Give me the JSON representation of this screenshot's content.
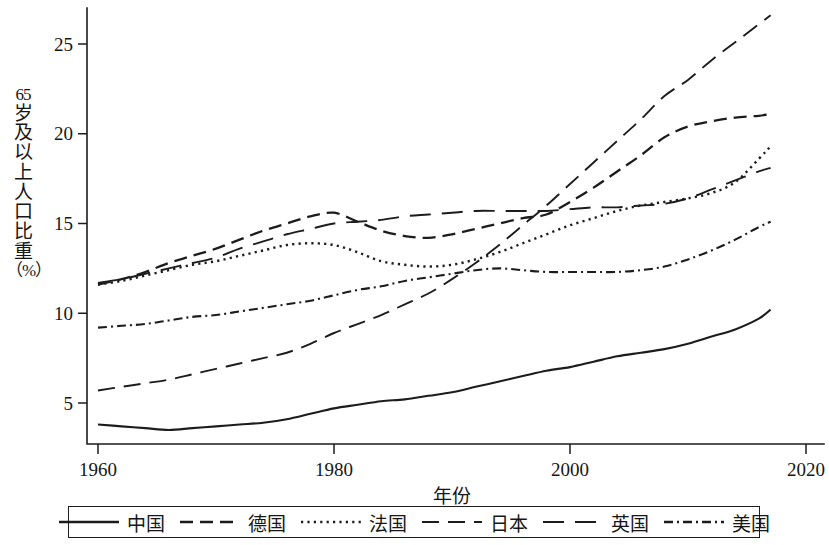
{
  "chart_data": {
    "type": "line",
    "title": "",
    "xlabel": "年份",
    "ylabel": "65岁及以上人口比重（%）",
    "xlim": [
      1960,
      2020
    ],
    "ylim": [
      2.8,
      27.6
    ],
    "xticks": [
      1960,
      1980,
      2000,
      2020
    ],
    "yticks": [
      5,
      10,
      15,
      20,
      25
    ],
    "grid": false,
    "legend_position": "bottom",
    "x": [
      1960,
      1962,
      1964,
      1966,
      1968,
      1970,
      1972,
      1974,
      1976,
      1978,
      1980,
      1982,
      1984,
      1986,
      1988,
      1990,
      1992,
      1994,
      1996,
      1998,
      2000,
      2002,
      2004,
      2006,
      2008,
      2010,
      2012,
      2014,
      2016,
      2017
    ],
    "series": [
      {
        "name": "中国",
        "dash": "solid",
        "values": [
          3.8,
          3.7,
          3.6,
          3.5,
          3.6,
          3.7,
          3.8,
          3.9,
          4.1,
          4.4,
          4.7,
          4.9,
          5.1,
          5.2,
          5.4,
          5.6,
          5.9,
          6.2,
          6.5,
          6.8,
          7.0,
          7.3,
          7.6,
          7.8,
          8.0,
          8.3,
          8.7,
          9.1,
          9.7,
          10.2
        ]
      },
      {
        "name": "德国",
        "dash": "dashed",
        "values": [
          11.6,
          11.9,
          12.3,
          12.8,
          13.2,
          13.6,
          14.1,
          14.6,
          15.0,
          15.4,
          15.6,
          15.1,
          14.6,
          14.3,
          14.2,
          14.4,
          14.7,
          15.0,
          15.3,
          15.5,
          16.2,
          17.0,
          17.9,
          18.8,
          19.8,
          20.4,
          20.7,
          20.9,
          21.0,
          21.1
        ]
      },
      {
        "name": "法国",
        "dash": "dotted",
        "values": [
          11.6,
          11.8,
          12.1,
          12.4,
          12.7,
          12.9,
          13.2,
          13.5,
          13.8,
          13.9,
          13.8,
          13.4,
          12.9,
          12.7,
          12.6,
          12.7,
          13.0,
          13.4,
          13.9,
          14.4,
          14.9,
          15.3,
          15.7,
          16.0,
          16.2,
          16.4,
          16.7,
          17.3,
          18.6,
          19.3
        ]
      },
      {
        "name": "日本",
        "dash": "longdash",
        "values": [
          5.7,
          5.9,
          6.1,
          6.3,
          6.6,
          6.9,
          7.2,
          7.5,
          7.8,
          8.3,
          8.9,
          9.4,
          9.9,
          10.5,
          11.1,
          11.9,
          12.8,
          13.8,
          14.9,
          16.0,
          17.2,
          18.4,
          19.6,
          20.8,
          22.1,
          23.0,
          24.1,
          25.1,
          26.1,
          26.6
        ]
      },
      {
        "name": "英国",
        "dash": "longdash2",
        "values": [
          11.7,
          11.9,
          12.2,
          12.5,
          12.8,
          13.1,
          13.6,
          14.0,
          14.4,
          14.7,
          15.0,
          15.1,
          15.2,
          15.4,
          15.5,
          15.6,
          15.7,
          15.7,
          15.7,
          15.7,
          15.8,
          15.9,
          15.9,
          16.0,
          16.1,
          16.4,
          16.9,
          17.4,
          17.9,
          18.1
        ]
      },
      {
        "name": "美国",
        "dash": "dashdot",
        "values": [
          9.2,
          9.3,
          9.4,
          9.6,
          9.8,
          9.9,
          10.1,
          10.3,
          10.5,
          10.7,
          11.0,
          11.3,
          11.5,
          11.8,
          12.0,
          12.2,
          12.4,
          12.5,
          12.4,
          12.3,
          12.3,
          12.3,
          12.3,
          12.4,
          12.6,
          13.0,
          13.5,
          14.1,
          14.8,
          15.1
        ]
      }
    ]
  },
  "axis": {
    "y_title_chars": [
      "65",
      "岁",
      "及",
      "以",
      "上",
      "人",
      "口",
      "比",
      "重",
      "（%）"
    ],
    "x_title": "年份",
    "ytick_labels": [
      "5",
      "10",
      "15",
      "20",
      "25"
    ],
    "xtick_labels": [
      "1960",
      "1980",
      "2000",
      "2020"
    ]
  },
  "legend": {
    "items": [
      {
        "label": "中国",
        "dash": "solid"
      },
      {
        "label": "德国",
        "dash": "dashed"
      },
      {
        "label": "法国",
        "dash": "dotted"
      },
      {
        "label": "日本",
        "dash": "longdash"
      },
      {
        "label": "英国",
        "dash": "longdash2"
      },
      {
        "label": "美国",
        "dash": "dashdot"
      }
    ]
  },
  "colors": {
    "line": "#1c1c1c",
    "axis": "#1d1d1d",
    "text": "#161616",
    "background": "#ffffff"
  }
}
